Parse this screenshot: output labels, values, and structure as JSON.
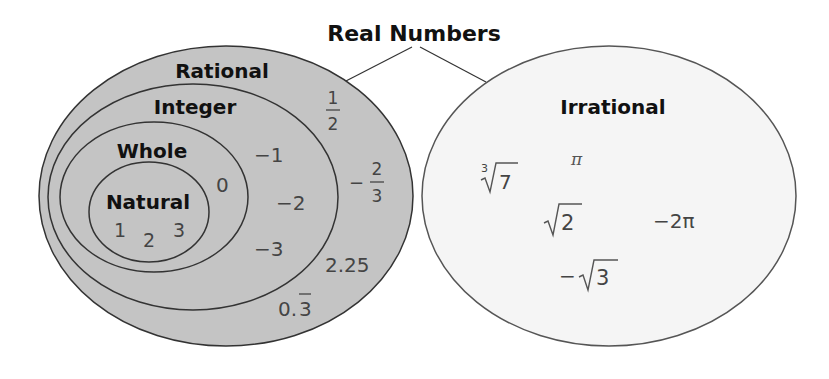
{
  "title": "Real Numbers",
  "sets": {
    "rational": {
      "label": "Rational",
      "fill": "#c4c4c4"
    },
    "integer": {
      "label": "Integer"
    },
    "whole": {
      "label": "Whole"
    },
    "natural": {
      "label": "Natural"
    },
    "irrational": {
      "label": "Irrational",
      "fill": "#f5f5f5"
    }
  },
  "members": {
    "natural": [
      "1",
      "2",
      "3"
    ],
    "whole": [
      "0"
    ],
    "integer": [
      "−1",
      "−2",
      "−3"
    ],
    "rational": {
      "half_num": "1",
      "half_den": "2",
      "neg_two_thirds_sign": "−",
      "neg_two_thirds_num": "2",
      "neg_two_thirds_den": "3",
      "decimal": "2.25",
      "repeating_base": "0.",
      "repeating_digit": "3"
    },
    "irrational": {
      "cube_root_index": "3",
      "cube_root_radicand": "7",
      "pi": "π",
      "sqrt2": "2",
      "neg_two_pi": "−2π",
      "neg_sqrt3_sign": "−",
      "neg_sqrt3": "3"
    }
  },
  "colors": {
    "stroke": "#333333",
    "rational_fill": "#c4c4c4",
    "irrational_fill": "#f5f5f5",
    "text": "#111111",
    "value_text": "#444444"
  }
}
